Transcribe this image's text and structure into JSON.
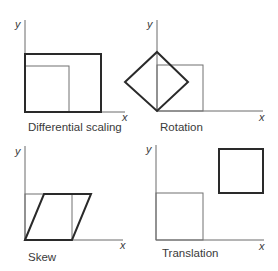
{
  "diagram": {
    "panels": [
      {
        "id": "differential-scaling",
        "caption": "Differential scaling",
        "x_axis_label": "x",
        "y_axis_label": "y"
      },
      {
        "id": "rotation",
        "caption": "Rotation",
        "x_axis_label": "x",
        "y_axis_label": "y"
      },
      {
        "id": "skew",
        "caption": "Skew",
        "x_axis_label": "x",
        "y_axis_label": "y"
      },
      {
        "id": "translation",
        "caption": "Translation",
        "x_axis_label": "x",
        "y_axis_label": "y"
      }
    ],
    "colors": {
      "axis": "#6a6a6a",
      "original_shape": "#707070",
      "transformed_shape": "#2a2a2a",
      "text": "#3a3a3a"
    }
  }
}
